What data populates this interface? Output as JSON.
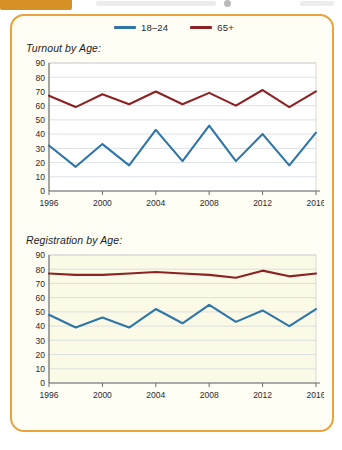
{
  "top_bar": {
    "tab_label": "",
    "tab_color": "#d79026"
  },
  "card": {
    "border_color": "#e8a33d",
    "background": "#fffdf4"
  },
  "legend": {
    "position": "top-center",
    "items": [
      {
        "label": "18–24",
        "color": "#2e75a8",
        "series_key": "18-24"
      },
      {
        "label": "65+",
        "color": "#8d2224",
        "series_key": "65+"
      }
    ]
  },
  "chart_data": [
    {
      "id": "turnout-by-age",
      "type": "line",
      "title": "Turnout by Age:",
      "xlabel": "",
      "ylabel": "",
      "ylim": [
        0,
        90
      ],
      "ytick_step": 10,
      "yticks": [
        0,
        10,
        20,
        30,
        40,
        50,
        60,
        70,
        80,
        90
      ],
      "grid": true,
      "plot_background": "#ffffff",
      "xlim": [
        1996,
        2016
      ],
      "x": [
        1996,
        1998,
        2000,
        2002,
        2004,
        2006,
        2008,
        2010,
        2012,
        2014,
        2016
      ],
      "xticks": [
        1996,
        2000,
        2004,
        2008,
        2012,
        2016
      ],
      "xtick_labels": [
        "1996",
        "2000",
        "2004",
        "2008",
        "2012",
        "2016"
      ],
      "series": [
        {
          "name": "18–24",
          "color": "#2e75a8",
          "values": [
            32,
            17,
            33,
            18,
            43,
            21,
            46,
            21,
            40,
            18,
            41
          ]
        },
        {
          "name": "65+",
          "color": "#8d2224",
          "values": [
            67,
            59,
            68,
            61,
            70,
            61,
            69,
            60,
            71,
            59,
            70
          ]
        }
      ]
    },
    {
      "id": "registration-by-age",
      "type": "line",
      "title": "Registration by Age:",
      "xlabel": "",
      "ylabel": "",
      "ylim": [
        0,
        90
      ],
      "ytick_step": 10,
      "yticks": [
        0,
        10,
        20,
        30,
        40,
        50,
        60,
        70,
        80,
        90
      ],
      "grid": true,
      "plot_background": "#fbfae6",
      "xlim": [
        1996,
        2016
      ],
      "x": [
        1996,
        1998,
        2000,
        2002,
        2004,
        2006,
        2008,
        2010,
        2012,
        2014,
        2016
      ],
      "xticks": [
        1996,
        2000,
        2004,
        2008,
        2012,
        2016
      ],
      "xtick_labels": [
        "1996",
        "2000",
        "2004",
        "2008",
        "2012",
        "2016"
      ],
      "series": [
        {
          "name": "18–24",
          "color": "#2e75a8",
          "values": [
            48,
            39,
            46,
            39,
            52,
            42,
            55,
            43,
            51,
            40,
            52
          ]
        },
        {
          "name": "65+",
          "color": "#8d2224",
          "values": [
            77,
            76,
            76,
            77,
            78,
            77,
            76,
            74,
            79,
            75,
            77
          ]
        }
      ]
    }
  ]
}
